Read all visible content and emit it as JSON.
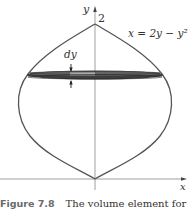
{
  "figure": {
    "labels": {
      "y_axis": "y",
      "x_axis": "x",
      "top_value": "2",
      "curve_equation": "x = 2y − y²",
      "thickness": "dy"
    },
    "caption": {
      "number": "Figure 7.8",
      "text": "The volume element for"
    },
    "colors": {
      "curve": "#555555",
      "axis": "#777777",
      "disk_dark": "#3a3a3a",
      "disk_light": "#b8b8b8"
    }
  }
}
